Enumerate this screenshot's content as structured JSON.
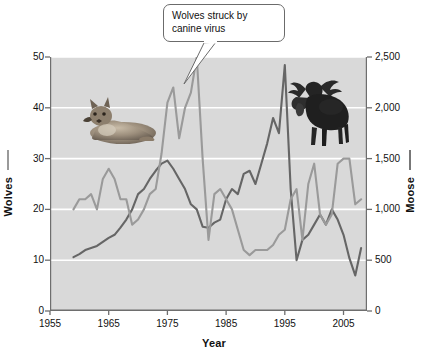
{
  "chart_data": {
    "type": "line",
    "title": "",
    "xlabel": "Year",
    "xlim": [
      1955,
      2009
    ],
    "xticks": [
      1955,
      1965,
      1975,
      1985,
      1995,
      2005
    ],
    "grid": true,
    "legend_position": "axis-labels",
    "annotations": [
      {
        "text": "Wolves struck by canine virus",
        "line1": "Wolves struck by",
        "line2": "canine virus",
        "points_to_year": 1980,
        "points_to_series": "Wolves"
      }
    ],
    "images": [
      {
        "name": "wolf-photo",
        "subject": "gray wolf lying down"
      },
      {
        "name": "moose-photo",
        "subject": "bull moose standing"
      }
    ],
    "axes": [
      {
        "name": "Wolves",
        "side": "left",
        "label": "Wolves",
        "ylim": [
          0,
          50
        ],
        "yticks": [
          0,
          10,
          20,
          30,
          40,
          50
        ],
        "ticklabels": [
          "0",
          "10",
          "20",
          "30",
          "40",
          "50"
        ],
        "color": "#9a9a9a"
      },
      {
        "name": "Moose",
        "side": "right",
        "label": "Moose",
        "ylim": [
          0,
          2500
        ],
        "yticks": [
          0,
          500,
          1000,
          1500,
          2000,
          2500
        ],
        "ticklabels": [
          "0",
          "500",
          "1,000",
          "1,500",
          "2,000",
          "2,500"
        ],
        "color": "#777777"
      }
    ],
    "series": [
      {
        "name": "Wolves",
        "axis": "left",
        "color": "#9a9a9a",
        "unit": "wolves",
        "x": [
          1959,
          1960,
          1961,
          1962,
          1963,
          1964,
          1965,
          1966,
          1967,
          1968,
          1969,
          1970,
          1971,
          1972,
          1973,
          1974,
          1975,
          1976,
          1977,
          1978,
          1979,
          1980,
          1981,
          1982,
          1983,
          1984,
          1985,
          1986,
          1987,
          1988,
          1989,
          1990,
          1991,
          1992,
          1993,
          1994,
          1995,
          1996,
          1997,
          1998,
          1999,
          2000,
          2001,
          2002,
          2003,
          2004,
          2005,
          2006,
          2007,
          2008
        ],
        "values": [
          20,
          22,
          22,
          23,
          20,
          26,
          28,
          26,
          22,
          22,
          17,
          18,
          20,
          23,
          24,
          31,
          41,
          44,
          34,
          40,
          43,
          50,
          30,
          14,
          23,
          24,
          22,
          20,
          16,
          12,
          11,
          12,
          12,
          12,
          13,
          15,
          16,
          22,
          24,
          14,
          25,
          29,
          19,
          17,
          19,
          29,
          30,
          30,
          21,
          22
        ]
      },
      {
        "name": "Moose",
        "axis": "right",
        "color": "#666666",
        "unit": "moose",
        "x": [
          1959,
          1960,
          1961,
          1962,
          1963,
          1964,
          1965,
          1966,
          1967,
          1968,
          1969,
          1970,
          1971,
          1972,
          1973,
          1974,
          1975,
          1976,
          1977,
          1978,
          1979,
          1980,
          1981,
          1982,
          1983,
          1984,
          1985,
          1986,
          1987,
          1988,
          1989,
          1990,
          1991,
          1992,
          1993,
          1994,
          1995,
          1996,
          1997,
          1998,
          1999,
          2000,
          2001,
          2002,
          2003,
          2004,
          2005,
          2006,
          2007,
          2008
        ],
        "values": [
          530,
          560,
          600,
          620,
          640,
          680,
          720,
          750,
          820,
          900,
          1000,
          1150,
          1200,
          1300,
          1380,
          1450,
          1480,
          1400,
          1300,
          1200,
          1050,
          1000,
          830,
          820,
          870,
          900,
          1100,
          1200,
          1150,
          1350,
          1380,
          1250,
          1450,
          1650,
          1900,
          1750,
          2420,
          1200,
          500,
          700,
          750,
          850,
          950,
          850,
          1000,
          900,
          750,
          520,
          350,
          620
        ]
      }
    ]
  },
  "left_axis": {
    "label": "Wolves",
    "ticks": [
      "50",
      "40",
      "30",
      "20",
      "10",
      "0"
    ]
  },
  "right_axis": {
    "label": "Moose",
    "ticks": [
      "2,500",
      "2,000",
      "1,500",
      "1,000",
      "500",
      "0"
    ]
  },
  "x_axis": {
    "label": "Year",
    "ticks": [
      "1955",
      "1965",
      "1975",
      "1985",
      "1995",
      "2005"
    ]
  },
  "callout": {
    "line1": "Wolves struck by",
    "line2": "canine virus"
  }
}
